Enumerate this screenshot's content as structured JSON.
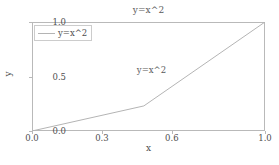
{
  "chart_data": {
    "type": "line",
    "title": "y=x^2",
    "xlabel": "x",
    "ylabel": "y",
    "xlim": [
      0.0,
      1.0
    ],
    "ylim": [
      0.0,
      1.0
    ],
    "grid": false,
    "legend_position": "upper left",
    "line_color": "#b4b4b4",
    "axis_color": "#b9b9b9",
    "text_color": "#4e4e4e",
    "background_color": "#ffffff",
    "series": [
      {
        "name": "y=x^2",
        "x": [
          0.0,
          0.48,
          1.0
        ],
        "y": [
          0.0,
          0.23,
          1.0
        ]
      }
    ],
    "xticks": [
      {
        "value": 0.0,
        "label": "0.0"
      },
      {
        "value": 0.3,
        "label": "0.3"
      },
      {
        "value": 0.6,
        "label": "0.6"
      },
      {
        "value": 1.0,
        "label": "1.0"
      }
    ],
    "yticks": [
      {
        "value": 0.0,
        "label": "0.0"
      },
      {
        "value": 0.5,
        "label": "0.5"
      },
      {
        "value": 1.0,
        "label": "1.0"
      }
    ],
    "annotations": [
      {
        "text": "y=x^2",
        "x": 0.45,
        "y": 0.56
      }
    ],
    "legend_entries": [
      {
        "label": "y=x^2"
      }
    ]
  }
}
